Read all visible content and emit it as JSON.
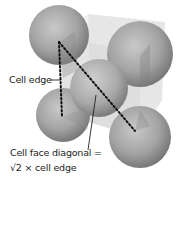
{
  "diagram": {
    "labels": {
      "cell_edge": "Cell edge",
      "face_diagonal_line1": "Cell face diagonal =",
      "face_diagonal_line2": "√2 × cell edge"
    },
    "colors": {
      "sphere_light": "#c8c8c8",
      "sphere_mid": "#9a9a9a",
      "sphere_dark": "#6e6e6e",
      "cube_fill": "#d9d9d9",
      "dotted_line": "#111111",
      "text": "#222222",
      "background": "#ffffff"
    },
    "spheres": [
      {
        "name": "top-left-corner-atom",
        "cx": 59,
        "cy": 35,
        "r": 30
      },
      {
        "name": "top-right-corner-atom",
        "cx": 140,
        "cy": 54,
        "r": 33
      },
      {
        "name": "bottom-left-corner-atom",
        "cx": 63,
        "cy": 115,
        "r": 27
      },
      {
        "name": "face-center-atom",
        "cx": 99,
        "cy": 88,
        "r": 29
      },
      {
        "name": "bottom-right-corner-atom",
        "cx": 140,
        "cy": 137,
        "r": 31
      }
    ]
  }
}
